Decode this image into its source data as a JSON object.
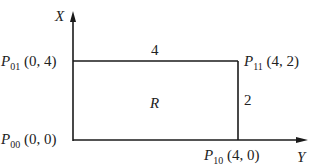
{
  "axes": {
    "vertical_label": "X",
    "horizontal_label": "Y"
  },
  "region_label": "R",
  "side_labels": {
    "top": "4",
    "right": "2"
  },
  "points": [
    {
      "name": "P",
      "sub": "01",
      "coords": "(0, 4)"
    },
    {
      "name": "P",
      "sub": "11",
      "coords": "(4, 2)"
    },
    {
      "name": "P",
      "sub": "00",
      "coords": "(0, 0)"
    },
    {
      "name": "P",
      "sub": "10",
      "coords": "(4, 0)"
    }
  ],
  "colors": {
    "line": "#1a1a1a",
    "background": "#ffffff"
  }
}
